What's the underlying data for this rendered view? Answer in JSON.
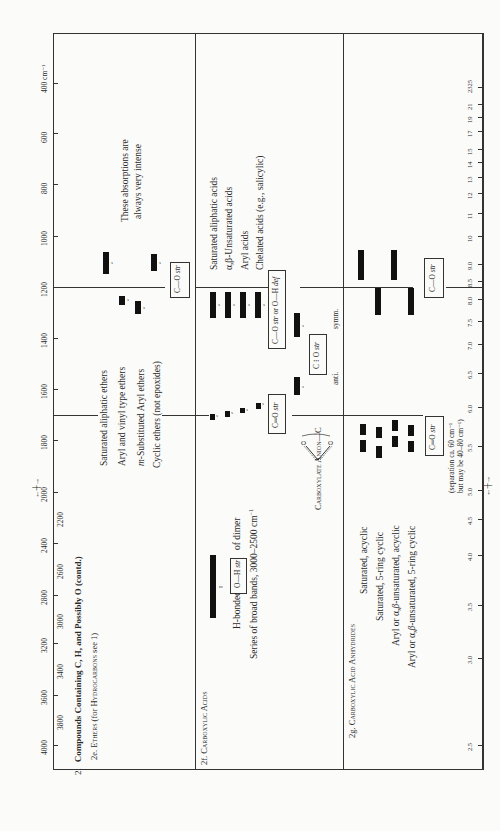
{
  "chart_data": {
    "type": "table",
    "orientation": "rotated 90° counter-clockwise",
    "xlabel": "Wavenumbers",
    "x_unit": "cm⁻¹",
    "secondary_xlabel": "Wavelength",
    "secondary_unit": "μm",
    "wavenumber_ticks_major": [
      "4000",
      "3600",
      "3200",
      "2800",
      "2400",
      "2000",
      "1800",
      "1600",
      "1400",
      "1200",
      "1000",
      "800",
      "600",
      "400 cm⁻¹"
    ],
    "wavenumber_ticks_minor": [
      "3800",
      "3400",
      "3000",
      "2600",
      "2200"
    ],
    "wavelength_ticks": [
      "2.5",
      "3.0",
      "3.5",
      "4.0",
      "4.5",
      "5.0",
      "5.5",
      "6.0",
      "6.5",
      "7.0",
      "7.5",
      "8.0",
      "8.5",
      "9.0",
      "10",
      "11",
      "12",
      "13",
      "14",
      "15",
      "17",
      "19",
      "21",
      "23",
      "25"
    ],
    "sections": [
      {
        "id": "2e",
        "title": "2e. Ethers (for Hydrocarbons see 1)",
        "note": "These absorptions are always very intense",
        "rows": [
          {
            "label": "Saturated aliphatic ethers",
            "bands": [
              {
                "from": 1150,
                "to": 1060,
                "intensity": "s"
              }
            ]
          },
          {
            "label": "Aryl and vinyl type ethers",
            "bands": [
              {
                "from": 1270,
                "to": 1230,
                "intensity": "s"
              }
            ]
          },
          {
            "label": "m-Substituted Aryl ethers",
            "bands": [
              {
                "from": 1310,
                "to": 1250,
                "intensity": "s"
              }
            ]
          },
          {
            "label": "Cyclic ethers (not epoxides)",
            "bands": [
              {
                "from": 1140,
                "to": 1070,
                "intensity": "s"
              }
            ]
          }
        ],
        "assignment": "C—O str"
      },
      {
        "id": "2f",
        "title": "2f. Carboxylic Acids",
        "rows": [
          {
            "label": "H-bonded O—H str of dimer",
            "bands": [
              {
                "from": 3000,
                "to": 2500,
                "intensity": "m"
              }
            ]
          },
          {
            "label": "Series of broad bands, 3000–2500 cm⁻¹",
            "bands": []
          },
          {
            "label": "Saturated aliphatic acids",
            "bands": [
              {
                "from": 1725,
                "to": 1700,
                "intensity": "s"
              },
              {
                "from": 1320,
                "to": 1210,
                "intensity": "s"
              }
            ]
          },
          {
            "label": "α,β-Unsaturated acids",
            "bands": [
              {
                "from": 1715,
                "to": 1690,
                "intensity": "s"
              },
              {
                "from": 1320,
                "to": 1210,
                "intensity": "s"
              }
            ]
          },
          {
            "label": "Aryl acids",
            "bands": [
              {
                "from": 1700,
                "to": 1680,
                "intensity": "s"
              },
              {
                "from": 1320,
                "to": 1210,
                "intensity": "s"
              }
            ]
          },
          {
            "label": "Chelated acids (e.g., salicylic)",
            "bands": [
              {
                "from": 1670,
                "to": 1650,
                "intensity": "s"
              },
              {
                "from": 1320,
                "to": 1210,
                "intensity": "s"
              }
            ]
          },
          {
            "label": "Carboxylate Anion",
            "bands": [
              {
                "from": 1610,
                "to": 1550,
                "intensity": "s"
              },
              {
                "from": 1400,
                "to": 1300,
                "intensity": "s"
              }
            ]
          }
        ],
        "assignments": [
          "O—H str",
          "C═O str",
          "C—O str or O—H def",
          "C ⁝ O str",
          "anti.",
          "symm."
        ]
      },
      {
        "id": "2g",
        "title": "2g. Carboxylic Acid Anhydrides",
        "rows": [
          {
            "label": "Saturated, acyclic",
            "bands": [
              {
                "from": 1840,
                "to": 1800,
                "intensity": "s"
              },
              {
                "from": 1775,
                "to": 1735,
                "intensity": "s"
              },
              {
                "from": 1170,
                "to": 1045,
                "intensity": "s"
              }
            ]
          },
          {
            "label": "Saturated, 5-ring cyclic",
            "bands": [
              {
                "from": 1870,
                "to": 1820,
                "intensity": "s"
              },
              {
                "from": 1800,
                "to": 1750,
                "intensity": "s"
              },
              {
                "from": 1310,
                "to": 1210,
                "intensity": "s"
              }
            ]
          },
          {
            "label": "Aryl or α,β-unsaturated, acyclic",
            "bands": [
              {
                "from": 1830,
                "to": 1780,
                "intensity": "s"
              },
              {
                "from": 1755,
                "to": 1710,
                "intensity": "s"
              },
              {
                "from": 1170,
                "to": 1045,
                "intensity": "s"
              }
            ]
          },
          {
            "label": "Aryl or α,β-unsaturated, 5-ring cyclic",
            "bands": [
              {
                "from": 1860,
                "to": 1820,
                "intensity": "s"
              },
              {
                "from": 1780,
                "to": 1750,
                "intensity": "s"
              },
              {
                "from": 1310,
                "to": 1210,
                "intensity": "s"
              }
            ]
          }
        ],
        "assignments": [
          "C═O str",
          "C—O str"
        ],
        "note": "(separation ca. 60 cm⁻¹ but may be 40–80 cm⁻¹)"
      }
    ]
  },
  "axis": {
    "wavenumbers_label": "Wavenumbers",
    "wavelength_label": "Wavelength",
    "unit_um": "μm",
    "major": [
      {
        "t": "4000",
        "y": 745
      },
      {
        "t": "3600",
        "y": 695
      },
      {
        "t": "3200",
        "y": 643
      },
      {
        "t": "2800",
        "y": 595
      },
      {
        "t": "2400",
        "y": 543
      },
      {
        "t": "2000",
        "y": 492
      },
      {
        "t": "1800",
        "y": 440
      },
      {
        "t": "1600",
        "y": 389
      },
      {
        "t": "1400",
        "y": 338
      },
      {
        "t": "1200",
        "y": 287
      },
      {
        "t": "1000",
        "y": 236
      },
      {
        "t": "800",
        "y": 184
      },
      {
        "t": "600",
        "y": 133
      },
      {
        "t": "400 cm⁻¹",
        "y": 83
      }
    ],
    "minor": [
      {
        "t": "3800",
        "y": 720
      },
      {
        "t": "3400",
        "y": 669
      },
      {
        "t": "3000",
        "y": 619
      },
      {
        "t": "2600",
        "y": 569
      },
      {
        "t": "2200",
        "y": 517
      }
    ],
    "um": [
      {
        "t": "2.5",
        "y": 745
      },
      {
        "t": "3.0",
        "y": 658
      },
      {
        "t": "3.5",
        "y": 605
      },
      {
        "t": "4.0",
        "y": 555
      },
      {
        "t": "4.5",
        "y": 519
      },
      {
        "t": "5.0",
        "y": 490
      },
      {
        "t": "5.5",
        "y": 446
      },
      {
        "t": "6.0",
        "y": 407
      },
      {
        "t": "6.5",
        "y": 373
      },
      {
        "t": "7.0",
        "y": 344
      },
      {
        "t": "7.5",
        "y": 321
      },
      {
        "t": "8.0",
        "y": 299
      },
      {
        "t": "8.5",
        "y": 281
      },
      {
        "t": "9.0",
        "y": 264
      },
      {
        "t": "10",
        "y": 236
      },
      {
        "t": "11",
        "y": 213
      },
      {
        "t": "12",
        "y": 193
      },
      {
        "t": "13",
        "y": 177
      },
      {
        "t": "14",
        "y": 162
      },
      {
        "t": "15",
        "y": 149
      },
      {
        "t": "17",
        "y": 131
      },
      {
        "t": "19",
        "y": 117
      },
      {
        "t": "21",
        "y": 104
      },
      {
        "t": "2325",
        "y": 87
      }
    ]
  },
  "text": {
    "heading_num": "2.",
    "heading": "Compounds Containing C, H, and Possibly O (contd.)",
    "sec_2e": "2e.",
    "sec_2e_title": "Ethers",
    "sec_2e_sub": "(for",
    "sec_2e_sub2": "Hydrocarbons",
    "sec_2e_sub3": "see 1)",
    "ether_note_1": "These absorptions are",
    "ether_note_2": "always very intense",
    "ether_r1": "Saturated aliphatic ethers",
    "ether_r2": "Aryl and vinyl type ethers",
    "ether_r3": "m-Substituted Aryl ethers",
    "ether_r4": "Cyclic ethers (not epoxides)",
    "co_str": "C—O str",
    "sec_2f": "2f.",
    "sec_2f_title": "Carboxylic Acids",
    "hbonded": "H-bonded",
    "oh_str": "O—H str",
    "of_dimer": "of dimer",
    "series": "Series of broad bands, 3000–2500 cm⁻¹",
    "acid_r1": "Saturated aliphatic acids",
    "acid_r2": "α,β-Unsaturated acids",
    "acid_r3": "Aryl acids",
    "acid_r4": "Chelated acids (e.g., salicylic)",
    "c_eq_o_str": "C═O str",
    "co_or_oh": "C—O str or O—H def",
    "carboxylate": "Carboxylate Anion",
    "c_dots_o_str": "C ⁝ O str",
    "anti": "anti.",
    "symm": "symm.",
    "sec_2g": "2g.",
    "sec_2g_title": "Carboxylic Acid Anhydrides",
    "anh_r1": "Saturated, acyclic",
    "anh_r2": "Saturated, 5-ring cyclic",
    "anh_r3": "Aryl or α,β-unsaturated, acyclic",
    "anh_r4": "Aryl or α,β-unsaturated, 5-ring cyclic",
    "sep_1": "(separation ca. 60 cm⁻¹",
    "sep_2": "but may be 40–80 cm⁻¹)",
    "s": "s",
    "m": "m"
  }
}
